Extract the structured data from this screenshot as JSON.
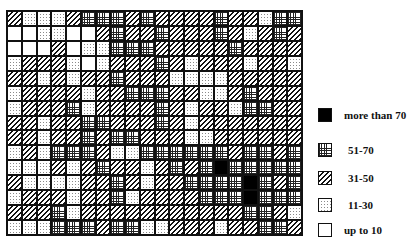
{
  "legend": {
    "items": [
      {
        "code": "B",
        "label": "more than 70",
        "top": 115,
        "label_offset": 0
      },
      {
        "code": "G",
        "label": "51-70",
        "top": 150,
        "label_offset": 4
      },
      {
        "code": "H",
        "label": "31-50",
        "top": 178,
        "label_offset": 4
      },
      {
        "code": "D",
        "label": "11-30",
        "top": 205,
        "label_offset": 4
      },
      {
        "code": "W",
        "label": "up to 10",
        "top": 230,
        "label_offset": 0
      }
    ]
  },
  "chart_data": {
    "type": "heatmap",
    "title": "",
    "columns": 20,
    "rows": 15,
    "categories": {
      "W": "up to 10",
      "D": "11-30",
      "H": "31-50",
      "G": "51-70",
      "B": "more than 70"
    },
    "grid": [
      "HDDDHGGGHGHHHHGHHDGG",
      "WWDDWWHGHHGHHHGHDHGH",
      "WWWHWDDGGGHHHHHGHHHH",
      "DHHHDWDHHHGHDHHHDHHD",
      "HHDHDHHGHHHDDDDHHHHH",
      "DHHHHDHHGGGHHDDHGHHH",
      "DHHHGDHHHHGHDHHDGGHH",
      "HHDHHGGHHHGHDHHHHHHH",
      "HHDHHGHGGHHHDDHHHHHH",
      "DHDGGGHDDGGGGGGHGGHG",
      "DDDHDHGHHDHGHGBGGGGG",
      "HDDDDHHGHDHHGGGGBGHG",
      "DHHHDHHGDHHHHGGGBGGG",
      "HHHGDHHHHHHHHHHHGGHD",
      "DDDGGGHGGDDHHHDHHGGH"
    ]
  }
}
